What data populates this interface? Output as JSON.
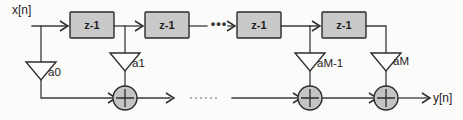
{
  "diagram": {
    "signals": {
      "input_label": "x[n]",
      "output_label": "y[n]"
    },
    "delay_blocks": [
      {
        "label": "z-1"
      },
      {
        "label": "z-1"
      },
      {
        "label": "z-1"
      },
      {
        "label": "z-1"
      }
    ],
    "gains": [
      {
        "label": "a0"
      },
      {
        "label": "a1"
      },
      {
        "label": "aM-1"
      },
      {
        "label": "aM"
      }
    ],
    "adders": [
      {
        "symbol": "+"
      },
      {
        "symbol": "+"
      },
      {
        "symbol": "+"
      }
    ],
    "ellipses": {
      "top": "•••",
      "bottom": ""
    },
    "colors": {
      "background": "#fbfbfa",
      "wire": "#3a3a3a",
      "block_fill": "#c9c9c9",
      "block_border": "#2b2b2b",
      "adder_fill": "#c4c4c4",
      "gain_fill": "#fdfdfd",
      "text": "#1d1d1d"
    }
  }
}
